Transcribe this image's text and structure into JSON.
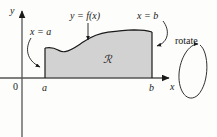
{
  "figure": {
    "background_color": "#fdfdfb",
    "region_fill_color": "#d2d2d2",
    "stroke_color": "#1a1a1a"
  },
  "axes": {
    "y_axis_label": "y",
    "x_axis_label": "x",
    "origin_label": "0"
  },
  "labels": {
    "left_boundary": "x = a",
    "right_boundary": "x = b",
    "curve": "y = f(x)",
    "region": "ℛ",
    "tick_a": "a",
    "tick_b": "b",
    "rotate": "rotate"
  },
  "geometry": {
    "y_axis_x": 22,
    "x_axis_y": 78,
    "region_left_x": 45,
    "region_right_x": 152,
    "curve_points": "45,48 52,47 58,50 64,52 72,50 82,43 92,37 104,33 116,31 128,30 138,30 146,31 152,32",
    "rotation_ellipse_cx": 193,
    "rotation_ellipse_cy": 70,
    "rotation_ellipse_rx": 13,
    "rotation_ellipse_ry": 28
  }
}
